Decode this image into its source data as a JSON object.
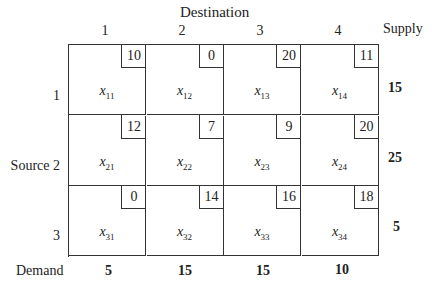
{
  "header": {
    "title": "Destination",
    "supply_label": "Supply"
  },
  "columns": [
    "1",
    "2",
    "3",
    "4"
  ],
  "row_labels": {
    "source_label": "Source",
    "rows": [
      "1",
      "2",
      "3"
    ]
  },
  "demand_label": "Demand",
  "cells": [
    [
      {
        "cost": "10",
        "var": "x",
        "sub": "11"
      },
      {
        "cost": "0",
        "var": "x",
        "sub": "12"
      },
      {
        "cost": "20",
        "var": "x",
        "sub": "13"
      },
      {
        "cost": "11",
        "var": "x",
        "sub": "14"
      }
    ],
    [
      {
        "cost": "12",
        "var": "x",
        "sub": "21"
      },
      {
        "cost": "7",
        "var": "x",
        "sub": "22"
      },
      {
        "cost": "9",
        "var": "x",
        "sub": "23"
      },
      {
        "cost": "20",
        "var": "x",
        "sub": "24"
      }
    ],
    [
      {
        "cost": "0",
        "var": "x",
        "sub": "31"
      },
      {
        "cost": "14",
        "var": "x",
        "sub": "32"
      },
      {
        "cost": "16",
        "var": "x",
        "sub": "33"
      },
      {
        "cost": "18",
        "var": "x",
        "sub": "34"
      }
    ]
  ],
  "supply": [
    "15",
    "25",
    "5"
  ],
  "demand": [
    "5",
    "15",
    "15",
    "10"
  ]
}
